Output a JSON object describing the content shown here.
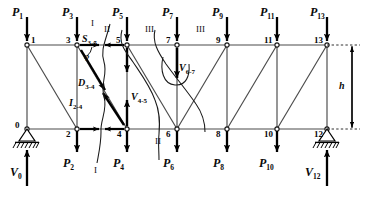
{
  "diagram": {
    "colors": {
      "line": "#3a3a3a",
      "bold": "#000000",
      "text": "#0a0a0a",
      "background": "#ffffff"
    },
    "geometry": {
      "panel_width": 50,
      "height_px": 84,
      "top_chord_y": 45,
      "bottom_chord_y": 129,
      "x_start": 27,
      "panels": 6
    },
    "top_nodes": [
      {
        "id": "1",
        "x": 27,
        "y": 45
      },
      {
        "id": "3",
        "x": 77,
        "y": 45
      },
      {
        "id": "5",
        "x": 127,
        "y": 45
      },
      {
        "id": "7",
        "x": 177,
        "y": 45
      },
      {
        "id": "9",
        "x": 227,
        "y": 45
      },
      {
        "id": "11",
        "x": 277,
        "y": 45
      },
      {
        "id": "13",
        "x": 327,
        "y": 45
      }
    ],
    "bottom_nodes": [
      {
        "id": "0",
        "x": 27,
        "y": 129
      },
      {
        "id": "2",
        "x": 77,
        "y": 129
      },
      {
        "id": "4",
        "x": 127,
        "y": 129
      },
      {
        "id": "6",
        "x": 177,
        "y": 129
      },
      {
        "id": "8",
        "x": 227,
        "y": 129
      },
      {
        "id": "10",
        "x": 277,
        "y": 129
      },
      {
        "id": "12",
        "x": 327,
        "y": 129
      }
    ],
    "external_loads": [
      {
        "label": "P",
        "sub": "1",
        "x": 27
      },
      {
        "label": "P",
        "sub": "3",
        "x": 77
      },
      {
        "label": "P",
        "sub": "5",
        "x": 127
      },
      {
        "label": "P",
        "sub": "7",
        "x": 177
      },
      {
        "label": "P",
        "sub": "9",
        "x": 227
      },
      {
        "label": "P",
        "sub": "11",
        "x": 277
      },
      {
        "label": "P",
        "sub": "13",
        "x": 327
      }
    ],
    "bottom_loads": [
      {
        "label": "P",
        "sub": "2",
        "x": 77
      },
      {
        "label": "P",
        "sub": "4",
        "x": 127
      },
      {
        "label": "P",
        "sub": "6",
        "x": 177
      },
      {
        "label": "P",
        "sub": "8",
        "x": 227
      },
      {
        "label": "P",
        "sub": "10",
        "x": 277
      }
    ],
    "reactions": [
      {
        "label": "V",
        "sub": "0",
        "x": 27
      },
      {
        "label": "V",
        "sub": "12",
        "x": 327
      }
    ],
    "section_cuts": [
      {
        "label": "I",
        "top_x": 110,
        "bottom_x": 103
      },
      {
        "label": "II",
        "top_x": 122,
        "bottom_x": 158
      },
      {
        "label": "III",
        "top_x": 155,
        "bottom_x": 205
      }
    ],
    "section_cut_bottom_labels": [
      {
        "label": "I",
        "x": 98
      },
      {
        "label": "II",
        "x": 159
      }
    ],
    "internal_forces": [
      {
        "label": "S",
        "sub": "3-5",
        "x": 83,
        "y": 42
      },
      {
        "label": "D",
        "sub": "3-4",
        "x": 82,
        "y": 83
      },
      {
        "label": "I",
        "sub": "2-4",
        "x": 74,
        "y": 101
      },
      {
        "label": "V",
        "sub": "4-5",
        "x": 138,
        "y": 95
      },
      {
        "label": "V",
        "sub": "6-7",
        "x": 181,
        "y": 67
      }
    ],
    "angle_label": "φ",
    "height_label": "h"
  }
}
